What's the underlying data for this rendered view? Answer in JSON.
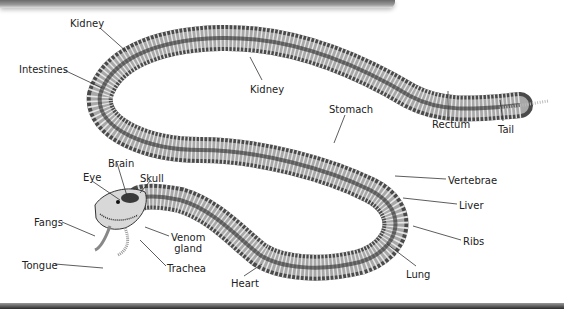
{
  "diagram": {
    "labels": [
      {
        "id": "kidney-1",
        "text": "Kidney",
        "x": 70,
        "y": 18
      },
      {
        "id": "intestines",
        "text": "Intestines",
        "x": 19,
        "y": 64
      },
      {
        "id": "kidney-2",
        "text": "Kidney",
        "x": 250,
        "y": 84
      },
      {
        "id": "stomach",
        "text": "Stomach",
        "x": 329,
        "y": 104
      },
      {
        "id": "rectum",
        "text": "Rectum",
        "x": 432,
        "y": 119
      },
      {
        "id": "tail",
        "text": "Tail",
        "x": 498,
        "y": 124
      },
      {
        "id": "vertebrae",
        "text": "Vertebrae",
        "x": 448,
        "y": 175
      },
      {
        "id": "brain",
        "text": "Brain",
        "x": 108,
        "y": 158
      },
      {
        "id": "eye",
        "text": "Eye",
        "x": 83,
        "y": 172
      },
      {
        "id": "skull",
        "text": "Skull",
        "x": 140,
        "y": 173
      },
      {
        "id": "liver",
        "text": "Liver",
        "x": 459,
        "y": 200
      },
      {
        "id": "fangs",
        "text": "Fangs",
        "x": 34,
        "y": 217
      },
      {
        "id": "venom-gland",
        "text": "Venom\ngland",
        "x": 171,
        "y": 232
      },
      {
        "id": "ribs",
        "text": "Ribs",
        "x": 463,
        "y": 236
      },
      {
        "id": "tongue",
        "text": "Tongue",
        "x": 22,
        "y": 260
      },
      {
        "id": "trachea",
        "text": "Trachea",
        "x": 167,
        "y": 263
      },
      {
        "id": "lung",
        "text": "Lung",
        "x": 406,
        "y": 269
      },
      {
        "id": "heart",
        "text": "Heart",
        "x": 231,
        "y": 278
      }
    ]
  }
}
